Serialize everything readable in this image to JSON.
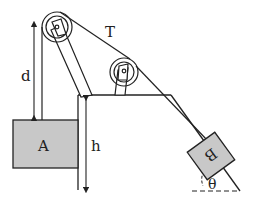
{
  "diagram": {
    "labels": {
      "tension": "T",
      "distance": "d",
      "height": "h",
      "block_a": "A",
      "block_b": "B",
      "angle": "θ"
    },
    "colors": {
      "line": "#222222",
      "block_fill": "#c8c8c8",
      "background": "#ffffff"
    }
  }
}
